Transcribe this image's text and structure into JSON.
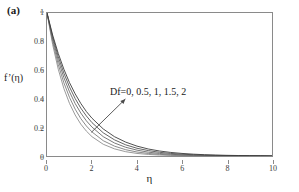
{
  "figure": {
    "panel_label": "(a)",
    "background_color": "#ffffff",
    "frame_color": "#8a8a8a"
  },
  "chart_data": {
    "type": "line",
    "title": "",
    "subtitle": "",
    "panel": "(a)",
    "xlabel": "η",
    "ylabel": "f’(η)",
    "xlim": [
      0,
      10
    ],
    "ylim": [
      0,
      1
    ],
    "xticks": [
      0,
      2,
      4,
      6,
      8,
      10
    ],
    "yticks": [
      0,
      0.2,
      0.4,
      0.6,
      0.8,
      1
    ],
    "xticklabels": [
      "0",
      "2",
      "4",
      "6",
      "8",
      "10"
    ],
    "yticklabels": [
      "0",
      "0.2",
      "0.4",
      "0.6",
      "0.8",
      "1"
    ],
    "grid": false,
    "legend": "none",
    "annotations": [
      {
        "text": "Df=0, 0.5, 1, 1.5, 2",
        "x": 4.1,
        "y": 0.44,
        "arrow": {
          "from_x": 2.0,
          "from_y": 0.17,
          "to_x": 3.5,
          "to_y": 0.4
        }
      }
    ],
    "parameter_name": "Df",
    "parameter_values": [
      0,
      0.5,
      1,
      1.5,
      2
    ],
    "x": [
      0,
      0.25,
      0.5,
      0.75,
      1,
      1.25,
      1.5,
      1.75,
      2,
      2.5,
      3,
      3.5,
      4,
      4.5,
      5,
      5.5,
      6,
      6.5,
      7,
      7.5,
      8,
      8.5,
      9,
      9.5,
      10
    ],
    "series": [
      {
        "name": "Df=0",
        "color": "#8f8f8f",
        "values": [
          1.0,
          0.78,
          0.607,
          0.472,
          0.368,
          0.287,
          0.223,
          0.174,
          0.135,
          0.082,
          0.05,
          0.03,
          0.018,
          0.011,
          0.0067,
          0.0041,
          0.0025,
          0.0015,
          0.0009,
          0.00055,
          0.00034,
          0.0002,
          0.00012,
          8e-05,
          0.0
        ]
      },
      {
        "name": "Df=0.5",
        "color": "#7d7d7d",
        "values": [
          1.0,
          0.8,
          0.64,
          0.512,
          0.41,
          0.328,
          0.262,
          0.21,
          0.168,
          0.107,
          0.069,
          0.044,
          0.028,
          0.018,
          0.0115,
          0.0074,
          0.0047,
          0.003,
          0.0019,
          0.0012,
          0.00078,
          0.0005,
          0.00032,
          0.0002,
          0.0
        ]
      },
      {
        "name": "Df=1",
        "color": "#6a6a6a",
        "values": [
          1.0,
          0.818,
          0.67,
          0.548,
          0.449,
          0.367,
          0.301,
          0.246,
          0.202,
          0.135,
          0.091,
          0.061,
          0.041,
          0.027,
          0.018,
          0.012,
          0.0081,
          0.0054,
          0.0036,
          0.0024,
          0.0016,
          0.0011,
          0.0007,
          0.00045,
          0.0
        ]
      },
      {
        "name": "Df=1.5",
        "color": "#545454",
        "values": [
          1.0,
          0.834,
          0.695,
          0.579,
          0.483,
          0.402,
          0.335,
          0.28,
          0.233,
          0.162,
          0.113,
          0.078,
          0.054,
          0.038,
          0.026,
          0.018,
          0.0126,
          0.0088,
          0.0061,
          0.0042,
          0.003,
          0.002,
          0.0014,
          0.001,
          0.0
        ]
      },
      {
        "name": "Df=2",
        "color": "#3c3c3c",
        "values": [
          1.0,
          0.846,
          0.717,
          0.607,
          0.513,
          0.435,
          0.368,
          0.311,
          0.264,
          0.189,
          0.135,
          0.097,
          0.069,
          0.049,
          0.035,
          0.025,
          0.018,
          0.0128,
          0.0091,
          0.0065,
          0.0046,
          0.0033,
          0.0024,
          0.0017,
          0.0
        ]
      }
    ]
  }
}
